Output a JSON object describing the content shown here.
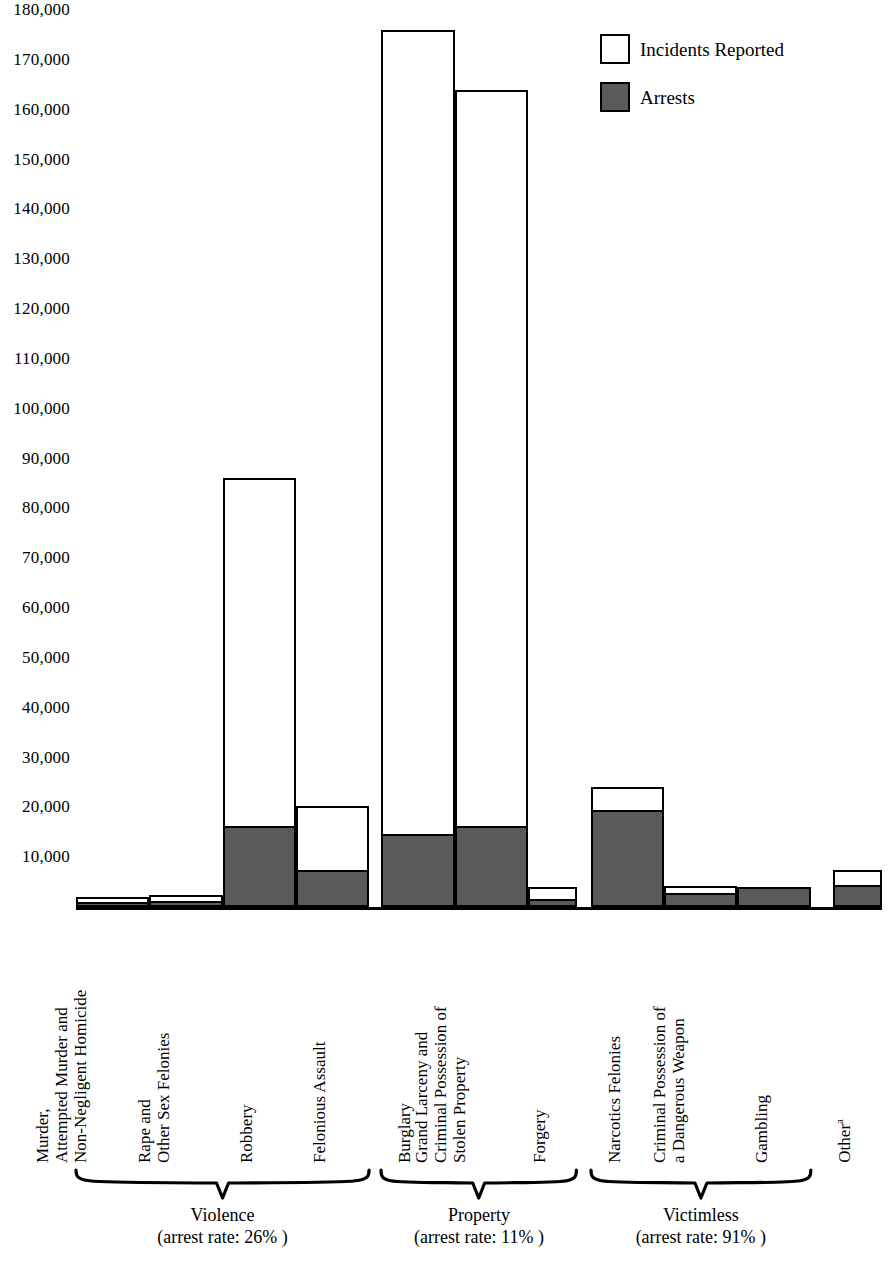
{
  "chart_data": {
    "type": "bar",
    "subtype": "overlaid-stacked",
    "title": "",
    "xlabel": "",
    "ylabel": "",
    "ylim": [
      0,
      180000
    ],
    "ytick_step": 10000,
    "grid": false,
    "legend_position": "top-right",
    "y_ticks": [
      "180,000",
      "170,000",
      "160,000",
      "150,000",
      "140,000",
      "130,000",
      "120,000",
      "110,000",
      "100,000",
      "90,000",
      "80,000",
      "70,000",
      "60,000",
      "50,000",
      "40,000",
      "30,000",
      "20,000",
      "10,000"
    ],
    "y_tick_values": [
      180000,
      170000,
      160000,
      150000,
      140000,
      130000,
      120000,
      110000,
      100000,
      90000,
      80000,
      70000,
      60000,
      50000,
      40000,
      30000,
      20000,
      10000
    ],
    "legend": [
      {
        "name": "incidents-reported",
        "label": "Incidents Reported",
        "swatch": "hollow",
        "color": "#ffffff"
      },
      {
        "name": "arrests",
        "label": "Arrests",
        "swatch": "filled",
        "color": "#5a5a5a"
      }
    ],
    "series": [
      {
        "name": "Incidents Reported",
        "values": [
          2000,
          2400,
          86000,
          20300,
          176000,
          164000,
          4000,
          24000,
          4300,
          4000,
          7500
        ]
      },
      {
        "name": "Arrests",
        "values": [
          1100,
          1200,
          16200,
          7500,
          14600,
          16300,
          1700,
          19500,
          2900,
          4000,
          4500
        ]
      }
    ],
    "categories": [
      {
        "id": "murder",
        "lines": [
          "Murder,",
          "Attempted  Murder and",
          "Non-Negligent Homicide"
        ],
        "group": "violence"
      },
      {
        "id": "rape",
        "lines": [
          "Rape and",
          "Other Sex Felonies"
        ],
        "group": "violence"
      },
      {
        "id": "robbery",
        "lines": [
          "Robbery"
        ],
        "group": "violence"
      },
      {
        "id": "assault",
        "lines": [
          "Felonious Assault"
        ],
        "group": "violence"
      },
      {
        "id": "burglary",
        "lines": [
          "Burglary"
        ],
        "group": "property"
      },
      {
        "id": "larceny",
        "lines": [
          "Grand Larceny and",
          "Criminal Possession of",
          "Stolen Property"
        ],
        "group": "property"
      },
      {
        "id": "forgery",
        "lines": [
          "Forgery"
        ],
        "group": "property"
      },
      {
        "id": "narcotics",
        "lines": [
          "Narcotics Felonies"
        ],
        "group": "victimless"
      },
      {
        "id": "weapon",
        "lines": [
          "Criminal Possession of",
          "a Dangerous Weapon"
        ],
        "group": "victimless"
      },
      {
        "id": "gambling",
        "lines": [
          "Gambling"
        ],
        "group": "victimless"
      },
      {
        "id": "other",
        "lines": [
          "Other"
        ],
        "superscript": "a",
        "group": "none"
      }
    ],
    "groups": [
      {
        "id": "violence",
        "label": "Violence",
        "note": "(arrest rate: 26% )",
        "arrest_rate": 26
      },
      {
        "id": "property",
        "label": "Property",
        "note": "(arrest rate: 11% )",
        "arrest_rate": 11
      },
      {
        "id": "victimless",
        "label": "Victimless",
        "note": "(arrest rate: 91% )",
        "arrest_rate": 91
      }
    ]
  }
}
